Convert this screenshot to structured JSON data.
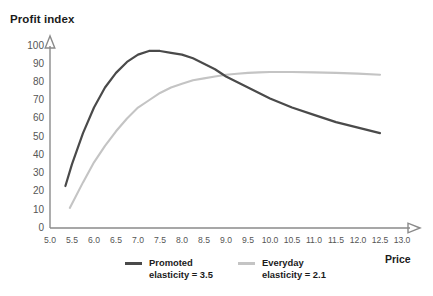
{
  "chart_data": {
    "type": "line",
    "title": "Profit index",
    "xlabel": "Price",
    "ylabel": "Profit index",
    "xlim": [
      5.0,
      13.0
    ],
    "ylim": [
      0,
      100
    ],
    "grid": false,
    "legend_position": "bottom",
    "x_ticks": [
      "5.0",
      "5.5",
      "6.0",
      "6.5",
      "7.0",
      "7.5",
      "8.0",
      "8.5",
      "9.0",
      "9.5",
      "10.0",
      "10.5",
      "11.0",
      "11.5",
      "12.0",
      "12.5",
      "13.0"
    ],
    "y_ticks": [
      "0",
      "10",
      "20",
      "30",
      "40",
      "50",
      "60",
      "70",
      "80",
      "90",
      "100"
    ],
    "series": [
      {
        "name": "Promoted elasticity = 3.5",
        "label_line1": "Promoted",
        "label_line2": "elasticity = 3.5",
        "color": "#4a4a4a",
        "x": [
          5.35,
          5.5,
          5.75,
          6.0,
          6.25,
          6.5,
          6.75,
          7.0,
          7.25,
          7.5,
          7.75,
          8.0,
          8.25,
          8.5,
          8.75,
          9.0,
          9.25,
          9.5,
          9.75,
          10.0,
          10.5,
          11.0,
          11.5,
          12.0,
          12.5
        ],
        "y": [
          23,
          35,
          52,
          66,
          77,
          85,
          91,
          95,
          97,
          97,
          96,
          95,
          93,
          90,
          87,
          83,
          80,
          77,
          74,
          71,
          66,
          62,
          58,
          55,
          52
        ]
      },
      {
        "name": "Everyday elasticity = 2.1",
        "label_line1": "Everyday",
        "label_line2": "elasticity = 2.1",
        "color": "#c4c4c4",
        "x": [
          5.45,
          5.75,
          6.0,
          6.25,
          6.5,
          6.75,
          7.0,
          7.25,
          7.5,
          7.75,
          8.0,
          8.25,
          8.5,
          8.75,
          9.0,
          9.25,
          9.5,
          9.75,
          10.0,
          10.5,
          11.0,
          11.5,
          12.0,
          12.5
        ],
        "y": [
          11,
          25,
          36,
          45,
          53,
          60,
          66,
          70,
          74,
          77,
          79,
          81,
          82,
          83,
          84,
          84.5,
          85,
          85.3,
          85.5,
          85.5,
          85.3,
          85,
          84.6,
          84
        ]
      }
    ]
  },
  "legend": {
    "promoted": {
      "line1": "Promoted",
      "line2": "elasticity = 3.5",
      "color": "#4a4a4a"
    },
    "everyday": {
      "line1": "Everyday",
      "line2": "elasticity = 2.1",
      "color": "#c4c4c4"
    }
  },
  "axes": {
    "x_axis_label": "Price",
    "y_axis_title": "Profit index"
  },
  "colors": {
    "promoted_line": "#4a4a4a",
    "everyday_line": "#c4c4c4",
    "axis": "#8a8a8a",
    "tick_text": "#555555",
    "title_text": "#1b1b1b",
    "background": "#ffffff"
  }
}
